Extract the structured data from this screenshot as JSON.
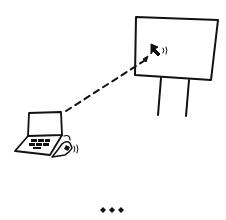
{
  "illustration": {
    "style": "hand-drawn sketch",
    "ink_color": "#111111",
    "background_color": "#ffffff",
    "elements": [
      {
        "name": "presentation-screen",
        "icon": "screen-on-stand-icon"
      },
      {
        "name": "cursor-on-screen",
        "icon": "cursor-arrow-icon"
      },
      {
        "name": "dashed-connection-arrow",
        "icon": "dashed-arrow-icon"
      },
      {
        "name": "laptop",
        "icon": "laptop-icon"
      },
      {
        "name": "hand-clicking",
        "icon": "hand-click-icon"
      },
      {
        "name": "more-indicator",
        "icon": "three-diamonds-icon"
      }
    ]
  }
}
